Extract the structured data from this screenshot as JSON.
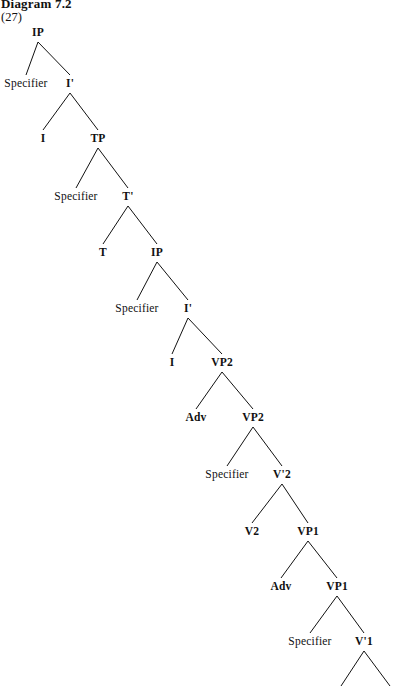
{
  "figure": {
    "heading": "Diagram 7.2",
    "example_number": "(27)",
    "ink_color": "#111111",
    "background_color": "#ffffff"
  },
  "diagram": {
    "type": "syntax-tree",
    "notation": "X-bar",
    "width": 401,
    "height": 686,
    "nodes": [
      {
        "id": "n0",
        "label": "IP",
        "x": 38,
        "y": 32,
        "level": 0
      },
      {
        "id": "n1",
        "label": "Specifier",
        "x": 26,
        "y": 83,
        "level": 1
      },
      {
        "id": "n2",
        "label": "I'",
        "x": 70,
        "y": 83,
        "level": 1
      },
      {
        "id": "n3",
        "label": "I",
        "x": 43,
        "y": 138,
        "level": 2
      },
      {
        "id": "n4",
        "label": "TP",
        "x": 98,
        "y": 138,
        "level": 2
      },
      {
        "id": "n5",
        "label": "Specifier",
        "x": 76,
        "y": 196,
        "level": 3
      },
      {
        "id": "n6",
        "label": "T'",
        "x": 128,
        "y": 196,
        "level": 3
      },
      {
        "id": "n7",
        "label": "T",
        "x": 103,
        "y": 252,
        "level": 4
      },
      {
        "id": "n8",
        "label": "IP",
        "x": 157,
        "y": 252,
        "level": 4
      },
      {
        "id": "n9",
        "label": "Specifier",
        "x": 137,
        "y": 308,
        "level": 5
      },
      {
        "id": "n10",
        "label": "I'",
        "x": 188,
        "y": 308,
        "level": 5
      },
      {
        "id": "n11",
        "label": "I",
        "x": 172,
        "y": 362,
        "level": 6
      },
      {
        "id": "n12",
        "label": "VP2",
        "x": 222,
        "y": 362,
        "level": 6
      },
      {
        "id": "n13",
        "label": "Adv",
        "x": 196,
        "y": 417,
        "level": 7
      },
      {
        "id": "n14",
        "label": "VP2",
        "x": 253,
        "y": 417,
        "level": 7
      },
      {
        "id": "n15",
        "label": "Specifier",
        "x": 227,
        "y": 474,
        "level": 8
      },
      {
        "id": "n16",
        "label": "V'2",
        "x": 282,
        "y": 474,
        "level": 8
      },
      {
        "id": "n17",
        "label": "V2",
        "x": 252,
        "y": 531,
        "level": 9
      },
      {
        "id": "n18",
        "label": "VP1",
        "x": 308,
        "y": 531,
        "level": 9
      },
      {
        "id": "n19",
        "label": "Adv",
        "x": 281,
        "y": 586,
        "level": 10
      },
      {
        "id": "n20",
        "label": "VP1",
        "x": 337,
        "y": 586,
        "level": 10
      },
      {
        "id": "n21",
        "label": "Specifier",
        "x": 310,
        "y": 641,
        "level": 11
      },
      {
        "id": "n22",
        "label": "V'1",
        "x": 364,
        "y": 641,
        "level": 11
      }
    ],
    "edges": [
      {
        "from": "n0",
        "to": "n1"
      },
      {
        "from": "n0",
        "to": "n2"
      },
      {
        "from": "n2",
        "to": "n3"
      },
      {
        "from": "n2",
        "to": "n4"
      },
      {
        "from": "n4",
        "to": "n5"
      },
      {
        "from": "n4",
        "to": "n6"
      },
      {
        "from": "n6",
        "to": "n7"
      },
      {
        "from": "n6",
        "to": "n8"
      },
      {
        "from": "n8",
        "to": "n9"
      },
      {
        "from": "n8",
        "to": "n10"
      },
      {
        "from": "n10",
        "to": "n11"
      },
      {
        "from": "n10",
        "to": "n12"
      },
      {
        "from": "n12",
        "to": "n13"
      },
      {
        "from": "n12",
        "to": "n14"
      },
      {
        "from": "n14",
        "to": "n15"
      },
      {
        "from": "n14",
        "to": "n16"
      },
      {
        "from": "n16",
        "to": "n17"
      },
      {
        "from": "n16",
        "to": "n18"
      },
      {
        "from": "n18",
        "to": "n19"
      },
      {
        "from": "n18",
        "to": "n20"
      },
      {
        "from": "n20",
        "to": "n21"
      },
      {
        "from": "n20",
        "to": "n22"
      }
    ],
    "clipped_edges": [
      {
        "from": "n22",
        "to_x": 341,
        "to_y": 686,
        "note": "left branch of V'1 runs off bottom edge"
      },
      {
        "from": "n22",
        "to_x": 390,
        "to_y": 686,
        "note": "right branch of V'1 runs off bottom edge"
      }
    ]
  }
}
